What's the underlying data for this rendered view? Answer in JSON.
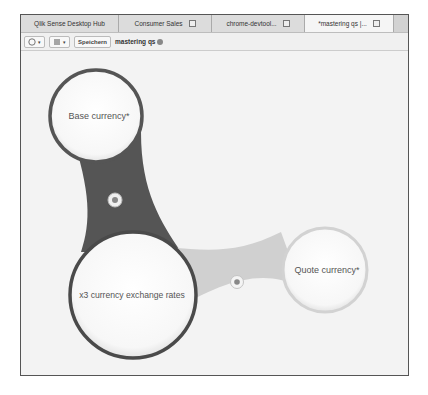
{
  "tabs": [
    {
      "label": "Qlik Sense Desktop Hub",
      "closable": false,
      "active": false
    },
    {
      "label": "Consumer Sales",
      "closable": true,
      "active": false
    },
    {
      "label": "chrome-devtool...",
      "closable": true,
      "active": false
    },
    {
      "label": "*mastering qs |...",
      "closable": true,
      "active": true
    }
  ],
  "toolbar": {
    "nav_icon": "compass-icon",
    "view_icon": "list-icon",
    "save_label": "Speichern",
    "app_title": "mastering qs",
    "info_icon": "info-icon"
  },
  "model": {
    "tables": [
      {
        "id": "base",
        "label": "Base currency*"
      },
      {
        "id": "rates",
        "label": "x3 currency exchange rates"
      },
      {
        "id": "quote",
        "label": "Quote currency*"
      }
    ],
    "links": [
      {
        "from": "base",
        "to": "rates",
        "color": "#555555"
      },
      {
        "from": "rates",
        "to": "quote",
        "color": "#d0d0d0"
      }
    ]
  }
}
